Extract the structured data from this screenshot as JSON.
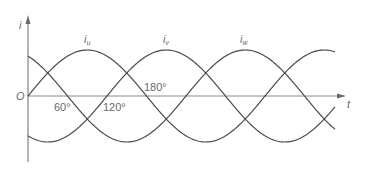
{
  "diagram": {
    "axes": {
      "y_label": "i",
      "x_label": "t",
      "origin_label": "O"
    },
    "series": [
      {
        "name": "i_u",
        "label_main": "i",
        "label_sub": "u",
        "phase_deg": 0
      },
      {
        "name": "i_v",
        "label_main": "i",
        "label_sub": "v",
        "phase_deg": -120
      },
      {
        "name": "i_w",
        "label_main": "i",
        "label_sub": "w",
        "phase_deg": -240
      }
    ],
    "angle_marks": [
      {
        "label": "60°"
      },
      {
        "label": "120°"
      },
      {
        "label": "180°"
      }
    ],
    "colors": {
      "curve": "#4a4a4a",
      "axis": "#6a6a6a",
      "text": "#6a6a6a",
      "background": "#ffffff"
    }
  }
}
